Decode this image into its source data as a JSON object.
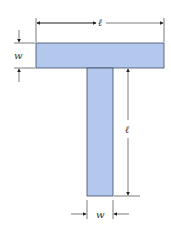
{
  "diagram": {
    "colors": {
      "fill": "#b3c8ec",
      "stroke": "#3a4a66",
      "dim": "#222222"
    },
    "top_bar": {
      "x": 36,
      "y": 43,
      "width": 128,
      "height": 25
    },
    "stem": {
      "x": 87,
      "y": 68,
      "width": 26,
      "height": 128
    },
    "labels": {
      "top_length": "ℓ",
      "top_width": "w",
      "stem_length": "ℓ",
      "stem_width": "w"
    }
  }
}
